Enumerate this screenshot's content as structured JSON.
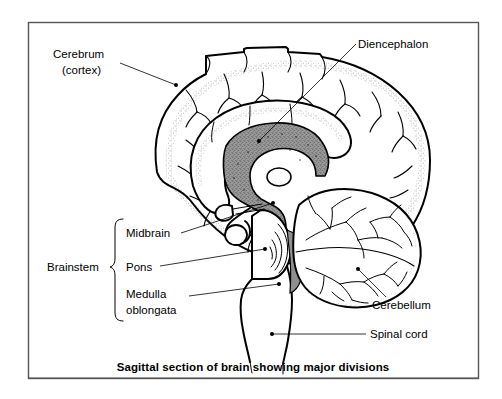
{
  "figure": {
    "caption": "Sagittal section of brain showing major divisions",
    "frame_color": "#555555",
    "ink_color": "#000000",
    "shade_color": "#999999",
    "background": "#ffffff"
  },
  "labels": {
    "cerebrum_line1": "Cerebrum",
    "cerebrum_line2": "(cortex)",
    "diencephalon": "Diencephalon",
    "brainstem": "Brainstem",
    "midbrain": "Midbrain",
    "pons": "Pons",
    "medulla_line1": "Medulla",
    "medulla_line2": "oblongata",
    "cerebellum": "Cerebellum",
    "spinal_cord": "Spinal cord"
  },
  "structures": [
    {
      "name": "cerebrum",
      "label": "Cerebrum (cortex)",
      "group": "forebrain",
      "shaded": false
    },
    {
      "name": "diencephalon",
      "label": "Diencephalon",
      "group": "forebrain",
      "shaded": true
    },
    {
      "name": "midbrain",
      "label": "Midbrain",
      "group": "brainstem",
      "shaded": false
    },
    {
      "name": "pons",
      "label": "Pons",
      "group": "brainstem",
      "shaded": false
    },
    {
      "name": "medulla-oblongata",
      "label": "Medulla oblongata",
      "group": "brainstem",
      "shaded": false
    },
    {
      "name": "cerebellum",
      "label": "Cerebellum",
      "group": "hindbrain",
      "shaded": false
    },
    {
      "name": "spinal-cord",
      "label": "Spinal cord",
      "group": "cns",
      "shaded": false
    }
  ]
}
